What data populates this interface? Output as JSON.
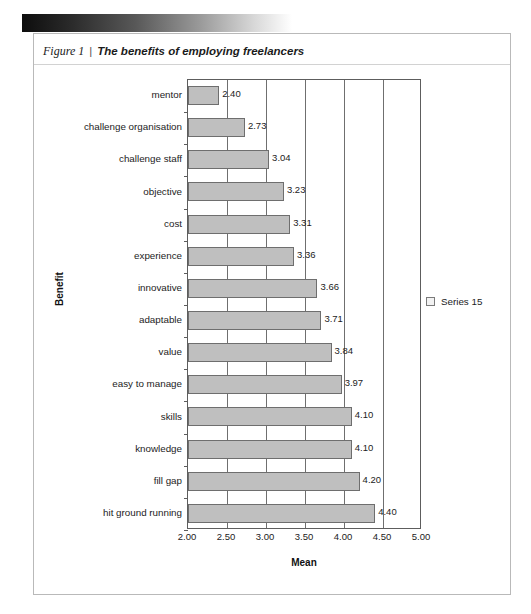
{
  "banner": {
    "name": "gradient-banner"
  },
  "figure": {
    "number": "Figure 1",
    "separator": "|",
    "title": "The benefits of employing freelancers"
  },
  "legend": {
    "entries": [
      {
        "label": "Series 15",
        "swatch_color": "#f2f2f2",
        "swatch_border": "#7a7a7a"
      }
    ]
  },
  "chart_data": {
    "type": "bar",
    "orientation": "horizontal",
    "title": "The benefits of employing freelancers",
    "xlabel": "Mean",
    "ylabel": "Benefit",
    "xlim": [
      2.0,
      5.0
    ],
    "xticks": [
      "2.00",
      "2.50",
      "3.00",
      "3.50",
      "4.00",
      "4.50",
      "5.00"
    ],
    "xtick_values": [
      2.0,
      2.5,
      3.0,
      3.5,
      4.0,
      4.5,
      5.0
    ],
    "grid": true,
    "legend_position": "right",
    "bar_fill": "#bfbfbf",
    "bar_border": "#6e6e6e",
    "series": [
      {
        "name": "Series 15",
        "categories": [
          "mentor",
          "challenge organisation",
          "challenge staff",
          "objective",
          "cost",
          "experience",
          "innovative",
          "adaptable",
          "value",
          "easy to manage",
          "skills",
          "knowledge",
          "fill gap",
          "hit ground running"
        ],
        "values": [
          2.4,
          2.73,
          3.04,
          3.23,
          3.31,
          3.36,
          3.66,
          3.71,
          3.84,
          3.97,
          4.1,
          4.1,
          4.2,
          4.4
        ],
        "labels": [
          "2.40",
          "2.73",
          "3.04",
          "3.23",
          "3.31",
          "3.36",
          "3.66",
          "3.71",
          "3.84",
          "3.97",
          "4.10",
          "4.10",
          "4.20",
          "4.40"
        ]
      }
    ]
  }
}
